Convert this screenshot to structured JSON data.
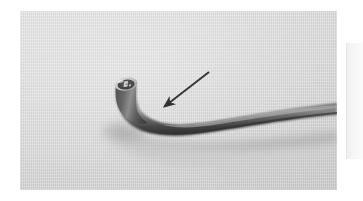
{
  "figure": {
    "kind": "photograph",
    "caption": "",
    "background_color": "#ffffff",
    "photo": {
      "name": "instrument-photograph",
      "alt": "Grayscale close-up photograph of a flexible tubular medical instrument with an angled distal tip resting on a light gray surface",
      "x": 20,
      "y": 11,
      "width": 317,
      "height": 179,
      "backdrop_color": "#d9d9d9",
      "object": {
        "name": "flexible-tube-instrument",
        "description": "dark gray flexible shaft curving up to an angled distal tip",
        "body_color": "#3a3a3a",
        "highlight_color": "#8e8e8e",
        "tip": {
          "name": "distal-tip",
          "collar_color": "#bdbdbd",
          "lumen_color": "#1e1e1e",
          "marking": "A"
        }
      },
      "shadow": {
        "name": "cast-shadow",
        "color": "#b4b4b4"
      }
    },
    "annotation": {
      "name": "pointer-arrow",
      "type": "arrow",
      "color": "#101010",
      "label": "",
      "tail_x": 209,
      "tail_y": 72,
      "head_x": 161,
      "head_y": 107,
      "points_to": "tube bend just distal to the tip"
    },
    "adjacent_panel": {
      "name": "adjacent-panel-edge",
      "color": "#f6f6f6"
    }
  }
}
